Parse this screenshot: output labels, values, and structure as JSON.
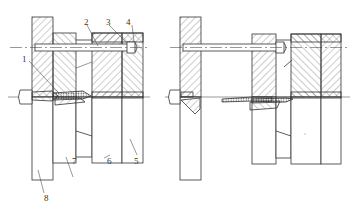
{
  "figure": {
    "type": "mechanical cross-section drawing",
    "views": [
      {
        "name": "left-view",
        "state": "mold closed"
      },
      {
        "name": "right-view",
        "state": "mold opened"
      }
    ],
    "labels": [
      {
        "id": "1",
        "text": "1"
      },
      {
        "id": "2",
        "text": "2"
      },
      {
        "id": "3",
        "text": "3"
      },
      {
        "id": "4",
        "text": "4"
      },
      {
        "id": "5",
        "text": "5"
      },
      {
        "id": "6",
        "text": "6"
      },
      {
        "id": "7",
        "text": "7"
      },
      {
        "id": "8",
        "text": "8"
      }
    ],
    "colors": {
      "line": "#333333",
      "hatch": "#555555",
      "background": "#ffffff"
    }
  }
}
